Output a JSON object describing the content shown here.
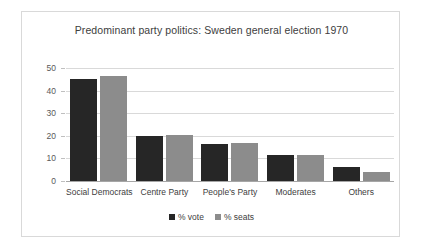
{
  "chart_data": {
    "type": "bar",
    "title": "Predominant party politics: Sweden general election 1970",
    "xlabel": "",
    "ylabel": "",
    "ylim": [
      0,
      50
    ],
    "yticks": [
      0,
      10,
      20,
      30,
      40,
      50
    ],
    "grid": true,
    "legend_position": "bottom",
    "categories": [
      "Social Democrats",
      "Centre Party",
      "People's Party",
      "Moderates",
      "Others"
    ],
    "series": [
      {
        "name": "% vote",
        "color": "#262626",
        "values": [
          45.3,
          19.9,
          16.2,
          11.5,
          6.1
        ]
      },
      {
        "name": "% seats",
        "color": "#8c8c8c",
        "values": [
          46.4,
          20.3,
          16.6,
          11.7,
          4.0
        ]
      }
    ]
  },
  "colors": {
    "vote": "#262626",
    "seats": "#8c8c8c",
    "gridline": "#d9d9d9",
    "axis": "#a6a6a6",
    "border": "#d9d9d9",
    "text": "#404040"
  }
}
